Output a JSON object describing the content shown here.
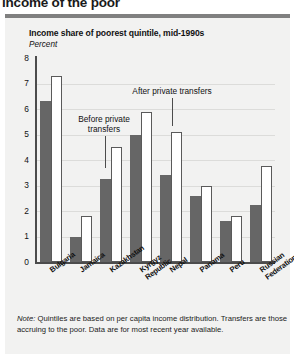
{
  "page": {
    "title": "income of the poor",
    "rule_color": "#808080"
  },
  "figure": {
    "title": "Income share of poorest quintile, mid-1990s",
    "subtitle": "Percent",
    "background": "#f2f2f1",
    "note_prefix": "Note:",
    "note_body": " Quintiles are based on per capita income distribution. Transfers are those accruing to the poor. Data are for most recent year available."
  },
  "annotations": [
    {
      "name": "before-private-transfers",
      "text_line1": "Before private",
      "text_line2": "transfers"
    },
    {
      "name": "after-private-transfers",
      "text_line1": "After private transfers",
      "text_line2": ""
    }
  ],
  "chart_data": {
    "type": "bar",
    "title": "Income share of poorest quintile, mid-1990s",
    "xlabel": "",
    "ylabel": "Percent",
    "ylim": [
      0,
      8
    ],
    "yticks": [
      0,
      1,
      2,
      3,
      4,
      5,
      6,
      7,
      8
    ],
    "grid": true,
    "legend": "annotated-callouts",
    "categories": [
      "Bulgaria",
      "Jamaica",
      "Kazakhstan",
      "Kyrgyz Republic",
      "Nepal",
      "Panama",
      "Peru",
      "Russian Federation"
    ],
    "series": [
      {
        "name": "Before private transfers",
        "color": "#666666",
        "values": [
          6.3,
          1.0,
          3.25,
          5.0,
          3.4,
          2.6,
          1.6,
          2.25
        ]
      },
      {
        "name": "After private transfers",
        "color": "#ffffff",
        "values": [
          7.3,
          1.8,
          4.5,
          5.9,
          5.1,
          3.0,
          1.8,
          3.75
        ]
      }
    ]
  }
}
